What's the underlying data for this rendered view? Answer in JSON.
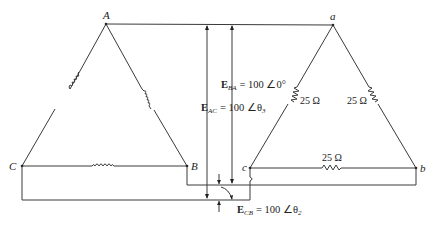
{
  "diagram": {
    "generator_nodes": {
      "A": "A",
      "B": "B",
      "C": "C"
    },
    "load_nodes": {
      "a": "a",
      "b": "b",
      "c": "c"
    },
    "resistors": [
      {
        "edge": "a-c",
        "label": "25 Ω"
      },
      {
        "edge": "a-b",
        "label": "25 Ω"
      },
      {
        "edge": "c-b",
        "label": "25 Ω"
      }
    ],
    "voltages": {
      "E_BA": {
        "symbol": "E",
        "sub": "BA",
        "value": "= 100 ∠0°"
      },
      "E_AC": {
        "symbol": "E",
        "sub": "AC",
        "value": "= 100 ∠θ",
        "angle_sub": "3"
      },
      "E_CB": {
        "symbol": "E",
        "sub": "CB",
        "value": "= 100 ∠θ",
        "angle_sub": "2"
      }
    }
  }
}
